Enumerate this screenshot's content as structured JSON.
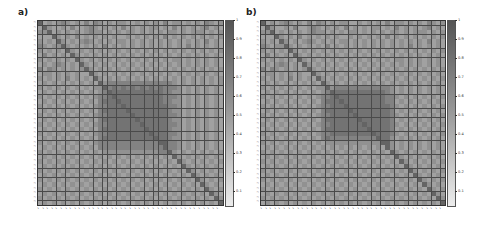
{
  "chart_data": [
    {
      "type": "heatmap",
      "panel_label": "a)",
      "title": "",
      "n_rows": 40,
      "n_cols": 40,
      "symmetric": true,
      "value_range": [
        0.03,
        1
      ],
      "colormap": "grayscale (dark = 1, light = 0)",
      "encoding": "each row string holds 40 digits; digit d = value d/10 (9 ≈ 0.9–1.0)",
      "matrix_rows": [
        "9565676565757656566556565657566565657656",
        "5965565755676565657565656656575656567565",
        "6695656565676656565665656565665656665656",
        "5559656575656565655656565657565656565656",
        "6565965656765656566565656565656565657565",
        "7656696565656575656565656565656575656565",
        "6565659656565656565656565656565656565656",
        "5756565965656565656565656565656565656565",
        "6565656596565656565656565656566565656565",
        "5656765659656565656565656565656565656565",
        "7576565656965656565656565656565656565656",
        "5665656565596565656565656565656565656565",
        "6565657565659656565656565656565656565656",
        "5656565656565967777777777777765656565656",
        "6565656565656697878787878787776565656565",
        "5656565656565679888888888887766565656565",
        "6565656565656778988888888887776565656565",
        "5656565656565788898888888887766565656565",
        "6565656565656778889888888888776565656565",
        "5656565656565788888988888888766565656565",
        "6565656565656778888898888888776565656565",
        "5656565656565788888889888888766565656565",
        "6565656565656778888888988888776565656565",
        "5656565656565788888888898888766565656565",
        "6565656565656778888888889888776565656565",
        "5656565656565788888888888988766565656565",
        "6565656565656777777777777799776565656565",
        "5656565656565777777777777779776565656565",
        "6565656565656566666666666677965656565656",
        "5656565656565656565656565656596565656565",
        "6565656565656565656565656565659656565656",
        "5656565656565656565656565656565965656565",
        "6565656565656565656565656565656596565656",
        "5656565656565656565656565656565659656565",
        "6565656565656565656565656565656565965656",
        "5656565656565656565656565656565656596565",
        "6565656565656565656565656565656565659656",
        "5656565656565656565656565656565656565965",
        "6565656565656565656565656565656565656596",
        "5656565656565656565656565656565656565659"
      ],
      "x_tick_labels": "40 rotated variable-name labels (illegible at this resolution)",
      "y_tick_labels": "40 variable-name labels (illegible at this resolution)",
      "colorbar": {
        "ticks": [
          1,
          0.9,
          0.8,
          0.7,
          0.6,
          0.5,
          0.4,
          0.3,
          0.2,
          0.1
        ]
      }
    },
    {
      "type": "heatmap",
      "panel_label": "b)",
      "title": "",
      "n_rows": 40,
      "n_cols": 40,
      "symmetric": true,
      "value_range": [
        0.03,
        1
      ],
      "colormap": "grayscale (dark = 1, light = 0)",
      "encoding": "each row string holds 40 digits; digit d = value d/10 (9 ≈ 0.9–1.0)",
      "matrix_rows": [
        "9565676565757656566556565657566565657656",
        "5965565755676565657565656656575656567565",
        "6695656565676656565665656565665656665656",
        "5559656575656565655656565657565656565656",
        "6565965656765656566565656565656565657565",
        "7656696565656575656565656565656575656565",
        "6565659656565656565656565656565656565656",
        "5756565965656565656565656565656565656565",
        "6565656596565656565656565656566565656565",
        "5656765659656565656565656565656565656565",
        "7576565656965656565656565656565656565656",
        "5665656565596565656565656565656565656565",
        "6565657565659656565656565656565656565656",
        "5656565656565965656565656565656565656565",
        "6565656565656696777777777777656565656565",
        "5656565656565679888888888887656565656565",
        "6565656565656778988888888887765656565656",
        "5656565656565788898888888887756565656565",
        "6565656565656778889888888888765656565656",
        "5656565656565788888988888888756565656565",
        "6565656565656778888898888888765656565656",
        "5656565656565788888889888888756565656565",
        "6565656565656778888888988888765656565656",
        "5656565656565788888888898888756565656565",
        "6565656565656778888888889888765656565656",
        "5656565656565787777777777988656565656565",
        "6565656565656566666666666699656565656565",
        "5656565656565656565656565659656565656565",
        "6565656565656565656565656565965656565656",
        "5656565656565656565656565656596565656565",
        "6565656565656565656565656565659656565656",
        "5656565656565656565656565656565965656565",
        "6565656565656565656565656565656596565656",
        "5656565656565656565656565656565659656565",
        "6565656565656565656565656565656565965656",
        "5656565656565656565656565656565656596565",
        "6565656565656565656565656565656565659656",
        "5656565656565656565656565656565656565965",
        "6565656565656565656565656565656565656596",
        "5656565656565656565656565656565656565659"
      ],
      "x_tick_labels": "40 rotated variable-name labels (illegible at this resolution)",
      "y_tick_labels": "40 variable-name labels (illegible at this resolution)",
      "colorbar": {
        "ticks": [
          1,
          0.9,
          0.8,
          0.7,
          0.6,
          0.5,
          0.4,
          0.3,
          0.2,
          0.1
        ]
      }
    }
  ],
  "panels": [
    {
      "label": "a)"
    },
    {
      "label": "b)"
    }
  ],
  "colorbar_ticks": [
    "1",
    "0.9",
    "0.8",
    "0.7",
    "0.6",
    "0.5",
    "0.4",
    "0.3",
    "0.2",
    "0.1"
  ],
  "colors": {
    "high": "#555555",
    "mid": "#9a9a9a",
    "low": "#ececec",
    "grid_line": "#4a4a4a"
  }
}
